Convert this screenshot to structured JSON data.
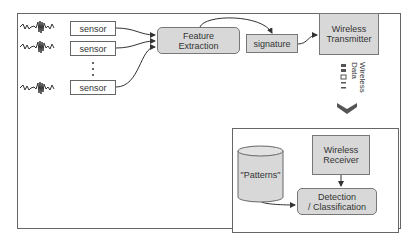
{
  "diagram": {
    "sensors": [
      {
        "label": "sensor"
      },
      {
        "label": "sensor"
      },
      {
        "label": "sensor"
      }
    ],
    "ellipsis": "...",
    "feature_extraction": {
      "line1": "Feature",
      "line2": "Extraction"
    },
    "signature": {
      "label": "signature"
    },
    "transmitter": {
      "line1": "Wireless",
      "line2": "Transmitter"
    },
    "wireless_data": {
      "line1": "Wireless",
      "line2": "Data"
    },
    "receiver": {
      "line1": "Wireless",
      "line2": "Receiver"
    },
    "patterns_db": {
      "label": "\"Patterns\""
    },
    "detection": {
      "line1": "Detection",
      "line2": "/ Classification"
    },
    "colors": {
      "box_fill": "#d8d8d8",
      "border": "#666666",
      "chevron": "#555555"
    }
  }
}
